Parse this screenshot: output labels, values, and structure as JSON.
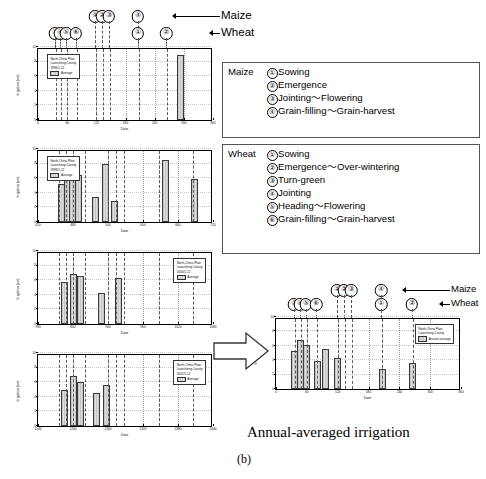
{
  "figure": {
    "caption_main": "Annual-averaged irrigation",
    "caption_panel": "(b)",
    "crop_labels": {
      "maize": "Maize",
      "wheat": "Wheat"
    }
  },
  "phenology": {
    "maize": {
      "name": "Maize",
      "stages": [
        {
          "num": "①",
          "label": "Sowing"
        },
        {
          "num": "②",
          "label": "Emergence"
        },
        {
          "num": "③",
          "label": "Jointing～Flowering"
        },
        {
          "num": "④",
          "label": "Grain-filling～Grain-harvest"
        }
      ]
    },
    "wheat": {
      "name": "Wheat",
      "stages": [
        {
          "num": "①",
          "label": "Sowing"
        },
        {
          "num": "②",
          "label": "Emergence～Over-wintering"
        },
        {
          "num": "③",
          "label": "Turn-green"
        },
        {
          "num": "④",
          "label": "Jointing"
        },
        {
          "num": "⑤",
          "label": "Heading～Flowering"
        },
        {
          "num": "⑥",
          "label": "Grain-filling～Grain-harvest"
        }
      ]
    }
  },
  "stage_markers_top": {
    "maize_row": [
      {
        "num": "①",
        "day": 120
      },
      {
        "num": "②",
        "day": 134
      },
      {
        "num": "③",
        "day": 148
      },
      {
        "num": "④",
        "day": 207
      }
    ],
    "wheat_row": [
      {
        "num": "③",
        "day": 36
      },
      {
        "num": "④",
        "day": 48
      },
      {
        "num": "⑤",
        "day": 60
      },
      {
        "num": "⑥",
        "day": 80
      },
      {
        "num": "①",
        "day": 207
      },
      {
        "num": "②",
        "day": 266
      }
    ]
  },
  "chart_data": [
    {
      "id": "chart-1996",
      "type": "bar",
      "title": "",
      "xlabel": "Date",
      "ylabel": "Irrigation (cm)",
      "legend": {
        "line1": "North-China Plain",
        "line2": "Luancheng County",
        "line3": "1996/1-12",
        "series": "Average"
      },
      "xlim": [
        0,
        360
      ],
      "ylim": [
        0,
        10
      ],
      "xticks": [
        0,
        60,
        120,
        180,
        240,
        300,
        360
      ],
      "yticks": [
        0,
        2,
        4,
        6,
        8,
        10
      ],
      "bars": [
        {
          "x": 294,
          "value": 8.9,
          "width": 7
        }
      ]
    },
    {
      "id": "chart-1998",
      "type": "bar",
      "title": "",
      "xlabel": "Date",
      "ylabel": "Irrigation (cm)",
      "legend": {
        "line1": "North-China Plain",
        "line2": "Luancheng County",
        "line3": "1998/1-12",
        "series": "Average"
      },
      "xlim": [
        420,
        720
      ],
      "ylim": [
        0,
        10
      ],
      "xticks": [
        420,
        480,
        540,
        600,
        660,
        720
      ],
      "yticks": [
        0,
        2,
        4,
        6,
        8,
        10
      ],
      "bars": [
        {
          "x": 461,
          "value": 5.2,
          "width": 7
        },
        {
          "x": 471,
          "value": 7.6,
          "width": 7
        },
        {
          "x": 479,
          "value": 6.1,
          "width": 7
        },
        {
          "x": 489,
          "value": 6.5,
          "width": 7
        },
        {
          "x": 519,
          "value": 3.4,
          "width": 7
        },
        {
          "x": 535,
          "value": 7.9,
          "width": 7
        },
        {
          "x": 551,
          "value": 2.9,
          "width": 7
        },
        {
          "x": 639,
          "value": 8.5,
          "width": 7
        },
        {
          "x": 688,
          "value": 5.9,
          "width": 7
        }
      ]
    },
    {
      "id": "chart-2000",
      "type": "bar",
      "title": "",
      "xlabel": "Date",
      "ylabel": "Irrigation (cm)",
      "legend": {
        "line1": "North-China Plain",
        "line2": "Luancheng County",
        "line3": "2000/1-12",
        "series": "Average"
      },
      "xlim": [
        780,
        1080
      ],
      "ylim": [
        0,
        10
      ],
      "xticks": [
        780,
        840,
        900,
        960,
        1020,
        1080
      ],
      "yticks": [
        0,
        2,
        4,
        6,
        8,
        10
      ],
      "bars": [
        {
          "x": 826,
          "value": 5.8,
          "width": 7
        },
        {
          "x": 840,
          "value": 6.9,
          "width": 7
        },
        {
          "x": 852,
          "value": 6.6,
          "width": 7
        },
        {
          "x": 888,
          "value": 4.2,
          "width": 7
        },
        {
          "x": 918,
          "value": 6.3,
          "width": 7
        }
      ]
    },
    {
      "id": "chart-2002",
      "type": "bar",
      "title": "",
      "xlabel": "Date",
      "ylabel": "Irrigation (cm)",
      "legend": {
        "line1": "North-China Plain",
        "line2": "Luancheng County",
        "line3": "2002/1-12",
        "series": "Average"
      },
      "xlim": [
        1140,
        1440
      ],
      "ylim": [
        0,
        10
      ],
      "xticks": [
        1140,
        1200,
        1260,
        1320,
        1380,
        1440
      ],
      "yticks": [
        0,
        2,
        4,
        6,
        8,
        10
      ],
      "bars": [
        {
          "x": 1186,
          "value": 5.0,
          "width": 7
        },
        {
          "x": 1200,
          "value": 6.8,
          "width": 7
        },
        {
          "x": 1212,
          "value": 6.0,
          "width": 7
        },
        {
          "x": 1241,
          "value": 4.5,
          "width": 7
        },
        {
          "x": 1258,
          "value": 5.6,
          "width": 7
        }
      ]
    },
    {
      "id": "chart-annual-average",
      "type": "bar",
      "title": "",
      "xlabel": "Date",
      "ylabel": "Irrigation (cm)",
      "legend": {
        "line1": "North-China Plain",
        "line2": "Luancheng County",
        "series": "Annual-average"
      },
      "xlim": [
        0,
        360
      ],
      "ylim": [
        0,
        10
      ],
      "xticks": [
        0,
        60,
        120,
        180,
        240,
        300,
        360
      ],
      "yticks": [
        0,
        2,
        4,
        6,
        8,
        10
      ],
      "bars": [
        {
          "x": 36,
          "value": 5.3,
          "width": 7
        },
        {
          "x": 48,
          "value": 6.8,
          "width": 7
        },
        {
          "x": 60,
          "value": 6.1,
          "width": 7
        },
        {
          "x": 80,
          "value": 3.9,
          "width": 7
        },
        {
          "x": 96,
          "value": 5.6,
          "width": 7
        },
        {
          "x": 120,
          "value": 4.3,
          "width": 7
        },
        {
          "x": 207,
          "value": 2.8,
          "width": 7
        },
        {
          "x": 266,
          "value": 3.6,
          "width": 7
        }
      ],
      "stage_markers": {
        "maize_row": [
          {
            "num": "①",
            "day": 120
          },
          {
            "num": "②",
            "day": 134
          },
          {
            "num": "③",
            "day": 148
          },
          {
            "num": "④",
            "day": 207
          }
        ],
        "wheat_row": [
          {
            "num": "③",
            "day": 36
          },
          {
            "num": "④",
            "day": 48
          },
          {
            "num": "⑤",
            "day": 60
          },
          {
            "num": "⑥",
            "day": 80
          },
          {
            "num": "①",
            "day": 207
          },
          {
            "num": "②",
            "day": 266
          }
        ]
      }
    }
  ]
}
